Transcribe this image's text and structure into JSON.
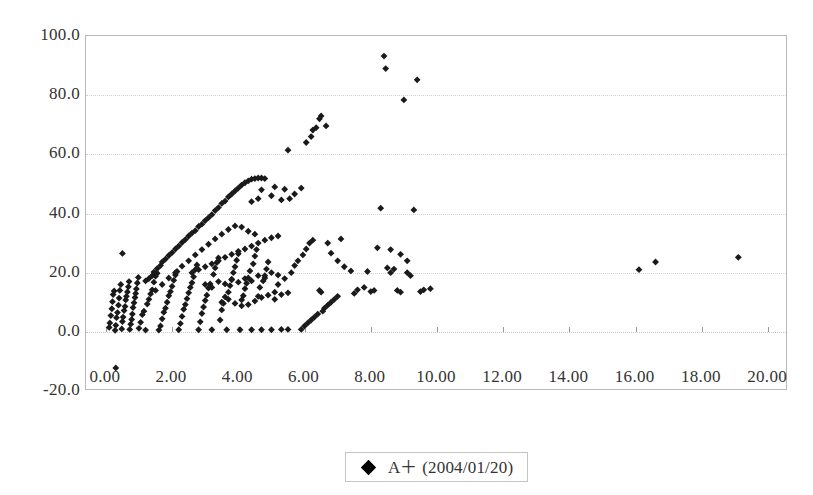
{
  "chart_data": {
    "type": "scatter",
    "title": "",
    "xlabel": "",
    "ylabel": "",
    "xlim": [
      -0.6,
      20.6
    ],
    "ylim": [
      -20.0,
      100.0
    ],
    "grid": true,
    "legend_position": "bottom-center",
    "marker": "diamond",
    "marker_color": "#1a1a1a",
    "axis_color": "#b9b9b9",
    "grid_color": "#d2d2d2",
    "x_ticks": [
      "0.00",
      "2.00",
      "4.00",
      "6.00",
      "8.00",
      "10.00",
      "12.00",
      "14.00",
      "16.00",
      "18.00",
      "20.00"
    ],
    "x_tick_values": [
      0,
      2,
      4,
      6,
      8,
      10,
      12,
      14,
      16,
      18,
      20
    ],
    "y_ticks": [
      "100.0",
      "80.0",
      "60.0",
      "40.0",
      "20.0",
      "0.0",
      "-20.0"
    ],
    "y_tick_values": [
      100,
      80,
      60,
      40,
      20,
      0,
      -20
    ],
    "series": [
      {
        "name": "A+ (2004/01/20)",
        "marker": "diamond",
        "color": "#1a1a1a",
        "points": [
          [
            0.3,
            -12.2
          ],
          [
            0.1,
            1.5
          ],
          [
            0.12,
            3.0
          ],
          [
            0.15,
            5.5
          ],
          [
            0.18,
            7.8
          ],
          [
            0.2,
            10.2
          ],
          [
            0.22,
            12.6
          ],
          [
            0.25,
            13.8
          ],
          [
            0.28,
            0.5
          ],
          [
            0.3,
            2.2
          ],
          [
            0.32,
            4.8
          ],
          [
            0.35,
            6.5
          ],
          [
            0.38,
            9.0
          ],
          [
            0.4,
            11.4
          ],
          [
            0.42,
            14.0
          ],
          [
            0.45,
            16.0
          ],
          [
            0.48,
            1.0
          ],
          [
            0.5,
            3.5
          ],
          [
            0.52,
            5.0
          ],
          [
            0.55,
            7.2
          ],
          [
            0.58,
            8.6
          ],
          [
            0.6,
            10.8
          ],
          [
            0.62,
            12.0
          ],
          [
            0.65,
            13.5
          ],
          [
            0.68,
            15.2
          ],
          [
            0.7,
            17.0
          ],
          [
            0.72,
            0.8
          ],
          [
            0.75,
            2.6
          ],
          [
            0.78,
            4.2
          ],
          [
            0.8,
            6.0
          ],
          [
            0.82,
            8.2
          ],
          [
            0.85,
            9.8
          ],
          [
            0.88,
            11.6
          ],
          [
            0.9,
            13.0
          ],
          [
            0.92,
            14.5
          ],
          [
            0.95,
            16.5
          ],
          [
            0.98,
            18.4
          ],
          [
            0.5,
            26.5
          ],
          [
            1.0,
            1.2
          ],
          [
            1.05,
            3.2
          ],
          [
            1.1,
            5.8
          ],
          [
            1.15,
            7.0
          ],
          [
            1.2,
            0.6
          ],
          [
            1.25,
            9.4
          ],
          [
            1.3,
            11.0
          ],
          [
            1.35,
            12.8
          ],
          [
            1.4,
            14.2
          ],
          [
            1.45,
            16.8
          ],
          [
            1.5,
            18.8
          ],
          [
            1.55,
            19.8
          ],
          [
            1.6,
            0.6
          ],
          [
            1.65,
            2.0
          ],
          [
            1.7,
            4.4
          ],
          [
            1.75,
            6.6
          ],
          [
            1.8,
            8.0
          ],
          [
            1.85,
            10.0
          ],
          [
            1.9,
            12.2
          ],
          [
            1.95,
            13.6
          ],
          [
            2.0,
            15.4
          ],
          [
            2.05,
            17.4
          ],
          [
            2.1,
            19.2
          ],
          [
            2.15,
            20.4
          ],
          [
            2.2,
            0.7
          ],
          [
            2.25,
            2.8
          ],
          [
            2.3,
            5.2
          ],
          [
            2.35,
            7.6
          ],
          [
            2.4,
            9.2
          ],
          [
            2.45,
            11.2
          ],
          [
            2.5,
            13.2
          ],
          [
            2.55,
            15.0
          ],
          [
            2.6,
            16.6
          ],
          [
            2.65,
            18.6
          ],
          [
            2.7,
            21.0
          ],
          [
            2.75,
            22.6
          ],
          [
            2.8,
            0.7
          ],
          [
            2.85,
            3.4
          ],
          [
            2.9,
            6.2
          ],
          [
            2.95,
            8.4
          ],
          [
            3.0,
            10.6
          ],
          [
            3.05,
            12.4
          ],
          [
            3.1,
            14.8
          ],
          [
            3.15,
            16.2
          ],
          [
            3.2,
            0.7
          ],
          [
            3.25,
            19.4
          ],
          [
            3.3,
            21.6
          ],
          [
            3.35,
            23.4
          ],
          [
            3.4,
            25.0
          ],
          [
            3.45,
            4.0
          ],
          [
            3.5,
            7.4
          ],
          [
            3.55,
            9.6
          ],
          [
            3.6,
            11.8
          ],
          [
            3.65,
            0.7
          ],
          [
            3.7,
            13.4
          ],
          [
            3.75,
            15.6
          ],
          [
            3.8,
            17.8
          ],
          [
            3.85,
            20.0
          ],
          [
            3.9,
            22.0
          ],
          [
            3.95,
            24.2
          ],
          [
            4.0,
            26.4
          ],
          [
            4.05,
            0.7
          ],
          [
            4.1,
            8.8
          ],
          [
            4.15,
            12.2
          ],
          [
            4.2,
            14.6
          ],
          [
            4.25,
            16.4
          ],
          [
            4.3,
            18.2
          ],
          [
            4.35,
            20.6
          ],
          [
            4.4,
            0.7
          ],
          [
            4.45,
            23.0
          ],
          [
            4.5,
            25.6
          ],
          [
            4.55,
            27.8
          ],
          [
            4.6,
            12.0
          ],
          [
            4.65,
            15.0
          ],
          [
            4.7,
            0.7
          ],
          [
            4.75,
            17.2
          ],
          [
            4.8,
            19.0
          ],
          [
            4.85,
            21.2
          ],
          [
            4.9,
            23.6
          ],
          [
            5.0,
            0.7
          ],
          [
            5.1,
            13.4
          ],
          [
            5.2,
            16.0
          ],
          [
            5.3,
            0.8
          ],
          [
            5.4,
            18.0
          ],
          [
            5.5,
            0.8
          ],
          [
            1.2,
            17.2
          ],
          [
            1.3,
            18.0
          ],
          [
            1.4,
            19.0
          ],
          [
            1.45,
            20.2
          ],
          [
            1.55,
            21.4
          ],
          [
            1.65,
            22.4
          ],
          [
            1.7,
            23.6
          ],
          [
            1.8,
            24.6
          ],
          [
            1.9,
            25.8
          ],
          [
            2.0,
            26.8
          ],
          [
            2.1,
            28.0
          ],
          [
            2.2,
            29.0
          ],
          [
            2.3,
            30.2
          ],
          [
            2.4,
            31.2
          ],
          [
            2.5,
            32.4
          ],
          [
            2.6,
            33.4
          ],
          [
            2.7,
            34.2
          ],
          [
            2.8,
            35.6
          ],
          [
            2.9,
            36.4
          ],
          [
            3.0,
            37.6
          ],
          [
            3.1,
            38.6
          ],
          [
            3.2,
            39.6
          ],
          [
            3.3,
            41.0
          ],
          [
            3.4,
            42.0
          ],
          [
            3.5,
            43.4
          ],
          [
            3.6,
            44.2
          ],
          [
            3.7,
            45.6
          ],
          [
            3.8,
            46.6
          ],
          [
            3.9,
            47.6
          ],
          [
            4.0,
            48.6
          ],
          [
            4.1,
            49.6
          ],
          [
            4.2,
            50.4
          ],
          [
            4.3,
            51.0
          ],
          [
            4.4,
            51.6
          ],
          [
            4.5,
            51.8
          ],
          [
            4.6,
            52.0
          ],
          [
            4.7,
            52.0
          ],
          [
            4.8,
            51.8
          ],
          [
            1.5,
            14.0
          ],
          [
            1.7,
            16.0
          ],
          [
            1.9,
            18.2
          ],
          [
            2.1,
            20.0
          ],
          [
            2.3,
            22.2
          ],
          [
            2.5,
            24.0
          ],
          [
            2.7,
            26.0
          ],
          [
            2.9,
            27.8
          ],
          [
            3.1,
            29.6
          ],
          [
            3.3,
            31.4
          ],
          [
            3.5,
            33.0
          ],
          [
            3.7,
            34.6
          ],
          [
            3.9,
            35.8
          ],
          [
            4.1,
            35.4
          ],
          [
            4.3,
            34.0
          ],
          [
            4.5,
            33.0
          ],
          [
            2.6,
            20.0
          ],
          [
            2.8,
            21.0
          ],
          [
            3.0,
            22.0
          ],
          [
            3.2,
            23.0
          ],
          [
            3.4,
            24.0
          ],
          [
            3.6,
            25.2
          ],
          [
            3.8,
            26.2
          ],
          [
            4.0,
            27.2
          ],
          [
            4.2,
            28.0
          ],
          [
            4.4,
            29.0
          ],
          [
            4.6,
            30.0
          ],
          [
            4.8,
            31.0
          ],
          [
            5.0,
            31.8
          ],
          [
            5.2,
            32.4
          ],
          [
            3.0,
            16.0
          ],
          [
            3.2,
            15.0
          ],
          [
            3.4,
            17.0
          ],
          [
            3.6,
            16.2
          ],
          [
            3.8,
            17.6
          ],
          [
            4.0,
            16.8
          ],
          [
            4.2,
            18.0
          ],
          [
            4.4,
            17.2
          ],
          [
            4.6,
            19.0
          ],
          [
            4.8,
            18.2
          ],
          [
            5.0,
            20.0
          ],
          [
            5.2,
            19.2
          ],
          [
            3.5,
            10.0
          ],
          [
            3.7,
            11.0
          ],
          [
            3.9,
            9.6
          ],
          [
            4.1,
            10.8
          ],
          [
            4.3,
            9.2
          ],
          [
            4.5,
            10.4
          ],
          [
            4.7,
            11.6
          ],
          [
            4.9,
            12.4
          ],
          [
            5.1,
            11.0
          ],
          [
            5.3,
            12.6
          ],
          [
            5.5,
            13.2
          ],
          [
            4.4,
            44.0
          ],
          [
            4.6,
            45.0
          ],
          [
            4.7,
            48.0
          ],
          [
            5.0,
            46.0
          ],
          [
            5.1,
            49.0
          ],
          [
            5.3,
            44.6
          ],
          [
            5.4,
            48.2
          ],
          [
            5.5,
            61.4
          ],
          [
            5.6,
            20.0
          ],
          [
            5.7,
            22.4
          ],
          [
            5.8,
            24.0
          ],
          [
            5.9,
            0.8
          ],
          [
            5.95,
            26.0
          ],
          [
            6.0,
            2.0
          ],
          [
            6.05,
            28.0
          ],
          [
            6.1,
            3.0
          ],
          [
            6.15,
            30.0
          ],
          [
            6.2,
            4.0
          ],
          [
            6.25,
            31.0
          ],
          [
            6.3,
            5.0
          ],
          [
            6.4,
            6.0
          ],
          [
            6.45,
            14.0
          ],
          [
            6.5,
            13.4
          ],
          [
            6.55,
            7.0
          ],
          [
            6.6,
            8.0
          ],
          [
            6.7,
            9.0
          ],
          [
            6.8,
            10.0
          ],
          [
            6.9,
            11.0
          ],
          [
            7.0,
            12.0
          ],
          [
            6.05,
            64.0
          ],
          [
            6.2,
            66.0
          ],
          [
            6.25,
            68.2
          ],
          [
            6.35,
            69.0
          ],
          [
            6.45,
            72.0
          ],
          [
            6.5,
            73.0
          ],
          [
            6.65,
            69.6
          ],
          [
            5.7,
            46.6
          ],
          [
            5.9,
            48.6
          ],
          [
            5.55,
            45.0
          ],
          [
            6.7,
            30.0
          ],
          [
            6.8,
            26.6
          ],
          [
            7.0,
            24.0
          ],
          [
            7.1,
            31.4
          ],
          [
            7.2,
            22.0
          ],
          [
            7.4,
            20.6
          ],
          [
            7.5,
            13.0
          ],
          [
            7.6,
            14.2
          ],
          [
            7.8,
            15.0
          ],
          [
            7.9,
            20.4
          ],
          [
            8.0,
            13.6
          ],
          [
            8.1,
            14.0
          ],
          [
            8.3,
            41.8
          ],
          [
            8.4,
            93.2
          ],
          [
            8.45,
            89.0
          ],
          [
            8.5,
            21.6
          ],
          [
            8.6,
            20.0
          ],
          [
            8.7,
            21.2
          ],
          [
            8.8,
            14.0
          ],
          [
            8.9,
            13.4
          ],
          [
            9.0,
            78.4
          ],
          [
            9.1,
            20.0
          ],
          [
            9.2,
            19.0
          ],
          [
            9.3,
            41.2
          ],
          [
            9.4,
            85.2
          ],
          [
            9.5,
            13.6
          ],
          [
            9.6,
            14.2
          ],
          [
            9.8,
            14.6
          ],
          [
            8.2,
            28.4
          ],
          [
            8.6,
            27.8
          ],
          [
            8.9,
            26.2
          ],
          [
            9.1,
            24.0
          ],
          [
            16.1,
            21.0
          ],
          [
            16.6,
            23.6
          ],
          [
            19.1,
            25.2
          ]
        ]
      }
    ]
  },
  "legend": {
    "entries": [
      {
        "label": "A＋ (2004/01/20)",
        "marker": "diamond-marker-icon",
        "color": "#1a1a1a"
      }
    ]
  }
}
